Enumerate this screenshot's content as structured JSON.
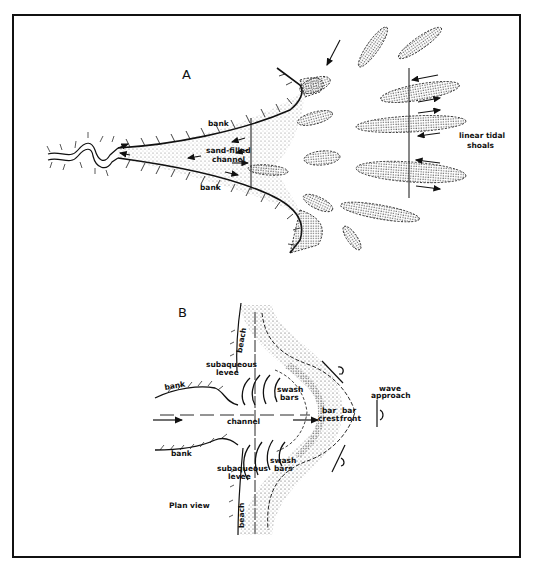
{
  "figure": {
    "panel_a": {
      "letter": "A",
      "labels": {
        "bank_top": "bank",
        "bank_bottom": "bank",
        "channel_line1": "sand-filled",
        "channel_line2": "channel",
        "shoals_line1": "linear tidal",
        "shoals_line2": "shoals"
      }
    },
    "panel_b": {
      "letter": "B",
      "labels": {
        "beach_top": "beach",
        "beach_bottom": "beach",
        "levee_top_1": "subaqueous",
        "levee_top_2": "levee",
        "levee_bottom_1": "subaqueous",
        "levee_bottom_2": "levee",
        "swash_top_1": "swash",
        "swash_top_2": "bars",
        "swash_bottom_1": "swash",
        "swash_bottom_2": "bars",
        "bank_top": "bank",
        "bank_bottom": "bank",
        "channel": "channel",
        "bar_crest_1": "bar",
        "bar_crest_2": "crest",
        "bar_front_1": "bar",
        "bar_front_2": "front",
        "wave_1": "wave",
        "wave_2": "approach",
        "plan_view": "Plan view"
      }
    },
    "colors": {
      "ink": "#111111",
      "stipple": "#555555",
      "background": "#ffffff"
    }
  }
}
